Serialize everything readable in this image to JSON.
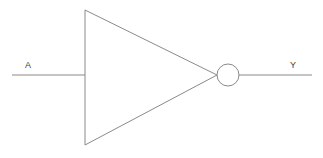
{
  "diagram": {
    "gate_type": "NOT",
    "background_color": "#ffffff",
    "stroke_color": "#8a8a8a",
    "label_color": "#3c3c3c"
  },
  "labels": {
    "input": "A",
    "output": "Y"
  },
  "geometry": {
    "canvas": {
      "width": 323,
      "height": 158
    },
    "triangle": {
      "points": "85,10 85,145 217,75",
      "top_vertex": [
        85,
        10
      ],
      "bottom_vertex": [
        85,
        145
      ],
      "apex": [
        217,
        75
      ]
    },
    "bubble": {
      "cx": 228,
      "cy": 75,
      "r": 11
    },
    "input_wire": {
      "x1": 12,
      "y1": 75,
      "x2": 85,
      "y2": 75
    },
    "output_wire": {
      "x1": 239,
      "y1": 75,
      "x2": 312,
      "y2": 75
    }
  }
}
